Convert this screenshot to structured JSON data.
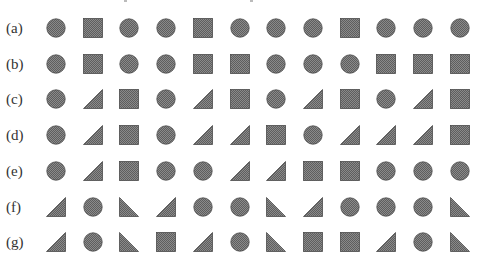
{
  "figure": {
    "fill_color": "#7d7d7d",
    "pattern_light": "#a8a8a8",
    "stroke_color": "#4a4a4a",
    "shape_legend": {
      "C": "circle",
      "S": "square",
      "T": "right-triangle-right-angle-bottom-right",
      "L": "right-triangle-right-angle-bottom-left"
    },
    "rows": [
      {
        "label": "(a)",
        "shapes": [
          "C",
          "S",
          "C",
          "C",
          "S",
          "C",
          "C",
          "C",
          "S",
          "C",
          "C",
          "C"
        ]
      },
      {
        "label": "(b)",
        "shapes": [
          "C",
          "S",
          "C",
          "C",
          "S",
          "S",
          "C",
          "C",
          "C",
          "S",
          "S",
          "S"
        ]
      },
      {
        "label": "(c)",
        "shapes": [
          "C",
          "T",
          "S",
          "C",
          "T",
          "S",
          "C",
          "T",
          "S",
          "C",
          "T",
          "S"
        ]
      },
      {
        "label": "(d)",
        "shapes": [
          "C",
          "T",
          "S",
          "C",
          "T",
          "T",
          "S",
          "C",
          "T",
          "T",
          "T",
          "S"
        ]
      },
      {
        "label": "(e)",
        "shapes": [
          "C",
          "T",
          "S",
          "C",
          "C",
          "T",
          "T",
          "S",
          "S",
          "C",
          "C",
          "C"
        ]
      },
      {
        "label": "(f)",
        "shapes": [
          "T",
          "C",
          "L",
          "T",
          "C",
          "C",
          "L",
          "T",
          "C",
          "C",
          "C",
          "L"
        ]
      },
      {
        "label": "(g)",
        "shapes": [
          "T",
          "C",
          "L",
          "S",
          "T",
          "C",
          "L",
          "S",
          "S",
          "T",
          "C",
          "L"
        ]
      }
    ]
  }
}
